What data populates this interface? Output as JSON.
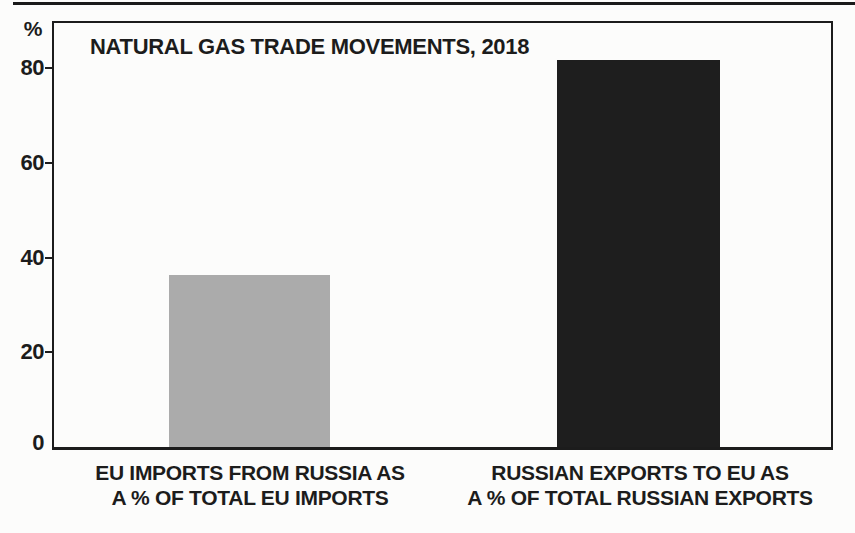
{
  "chart_data": {
    "type": "bar",
    "title": "NATURAL GAS TRADE MOVEMENTS, 2018",
    "ylabel": "%",
    "unit_label": "%",
    "categories": [
      {
        "line1": "EU IMPORTS FROM RUSSIA AS",
        "line2": "A % OF TOTAL EU IMPORTS"
      },
      {
        "line1": "RUSSIAN EXPORTS TO EU AS",
        "line2": "A % OF TOTAL RUSSIAN EXPORTS"
      }
    ],
    "values": [
      36,
      81
    ],
    "bar_colors": [
      "#ababab",
      "#1e1e1e"
    ],
    "yticks": [
      0,
      20,
      40,
      60,
      80
    ],
    "ylim": [
      0,
      88
    ],
    "grid": false,
    "legend": false,
    "ink_color": "#1c1c1c",
    "background_color": "#fcfcfb"
  }
}
